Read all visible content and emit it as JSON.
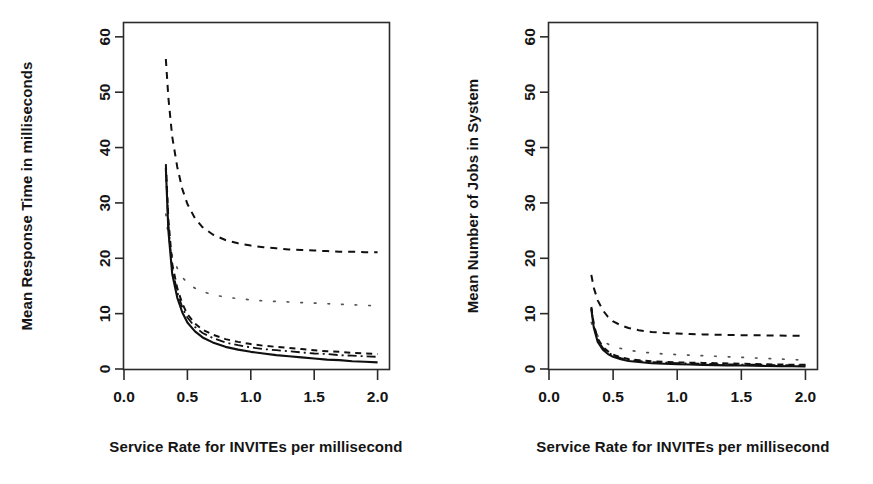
{
  "figure": {
    "background": "#ffffff",
    "foreground": "#141414",
    "panel_count": 2
  },
  "chart_data": [
    {
      "type": "line",
      "title": "",
      "xlabel": "Service Rate for INVITEs per millisecond",
      "ylabel": "Mean Response Time in milliseconds",
      "xlim": [
        0.0,
        2.09
      ],
      "ylim": [
        0.0,
        62.5
      ],
      "xticks": [
        0.0,
        0.5,
        1.0,
        1.5,
        2.0
      ],
      "xtick_labels": [
        "0.0",
        "0.5",
        "1.0",
        "1.5",
        "2.0"
      ],
      "yticks": [
        0,
        10,
        20,
        30,
        40,
        50,
        60
      ],
      "ytick_labels": [
        "0",
        "10",
        "20",
        "30",
        "40",
        "50",
        "60"
      ],
      "grid": false,
      "legend": "none",
      "x": [
        0.33,
        0.35,
        0.38,
        0.42,
        0.46,
        0.5,
        0.56,
        0.62,
        0.7,
        0.8,
        0.9,
        1.0,
        1.1,
        1.2,
        1.3,
        1.4,
        1.5,
        1.6,
        1.7,
        1.8,
        1.9,
        2.0
      ],
      "series": [
        {
          "name": "series-1-dashed-upper",
          "style": "dashed",
          "values": [
            56.0,
            49.0,
            42.0,
            36.5,
            32.5,
            29.8,
            27.2,
            25.6,
            24.3,
            23.3,
            22.7,
            22.3,
            22.0,
            21.8,
            21.6,
            21.5,
            21.4,
            21.3,
            21.2,
            21.2,
            21.1,
            21.1
          ]
        },
        {
          "name": "series-2-dotted-middle",
          "style": "dotted",
          "values": [
            28.0,
            24.0,
            20.5,
            18.2,
            16.6,
            15.5,
            14.6,
            14.0,
            13.4,
            13.0,
            12.7,
            12.5,
            12.3,
            12.2,
            12.1,
            12.0,
            11.9,
            11.8,
            11.7,
            11.6,
            11.5,
            11.4
          ]
        },
        {
          "name": "series-3-dashed-lower",
          "style": "dashed2",
          "values": [
            37.0,
            27.0,
            19.0,
            14.6,
            11.8,
            9.9,
            8.2,
            7.1,
            6.2,
            5.4,
            4.9,
            4.5,
            4.2,
            4.0,
            3.8,
            3.6,
            3.4,
            3.2,
            3.1,
            2.9,
            2.8,
            2.7
          ]
        },
        {
          "name": "series-4-dashdot-lower",
          "style": "dashdot",
          "values": [
            36.5,
            26.0,
            18.2,
            13.9,
            11.1,
            9.3,
            7.6,
            6.5,
            5.6,
            4.8,
            4.3,
            3.9,
            3.6,
            3.4,
            3.2,
            3.0,
            2.8,
            2.7,
            2.5,
            2.4,
            2.3,
            2.2
          ]
        },
        {
          "name": "series-5-solid-lowest",
          "style": "solid",
          "values": [
            36.3,
            25.0,
            17.2,
            12.9,
            10.2,
            8.4,
            6.8,
            5.7,
            4.8,
            4.0,
            3.5,
            3.1,
            2.8,
            2.5,
            2.3,
            2.1,
            1.9,
            1.7,
            1.6,
            1.4,
            1.3,
            1.2
          ]
        }
      ]
    },
    {
      "type": "line",
      "title": "",
      "xlabel": "Service Rate for INVITEs per millisecond",
      "ylabel": "Mean Number of Jobs in System",
      "xlim": [
        0.0,
        2.09
      ],
      "ylim": [
        0.0,
        62.5
      ],
      "xticks": [
        0.0,
        0.5,
        1.0,
        1.5,
        2.0
      ],
      "xtick_labels": [
        "0.0",
        "0.5",
        "1.0",
        "1.5",
        "2.0"
      ],
      "yticks": [
        0,
        10,
        20,
        30,
        40,
        50,
        60
      ],
      "ytick_labels": [
        "0",
        "10",
        "20",
        "30",
        "40",
        "50",
        "60"
      ],
      "grid": false,
      "legend": "none",
      "x": [
        0.33,
        0.35,
        0.38,
        0.42,
        0.46,
        0.5,
        0.56,
        0.62,
        0.7,
        0.8,
        0.9,
        1.0,
        1.1,
        1.2,
        1.3,
        1.4,
        1.5,
        1.6,
        1.7,
        1.8,
        1.9,
        2.0
      ],
      "series": [
        {
          "name": "series-1-dashed-upper",
          "style": "dashed",
          "values": [
            17.0,
            14.6,
            12.4,
            10.6,
            9.4,
            8.6,
            7.9,
            7.4,
            7.0,
            6.7,
            6.5,
            6.4,
            6.3,
            6.25,
            6.2,
            6.15,
            6.1,
            6.1,
            6.05,
            6.05,
            6.0,
            6.0
          ]
        },
        {
          "name": "series-2-dotted-middle",
          "style": "dotted",
          "values": [
            8.4,
            7.1,
            6.0,
            5.1,
            4.5,
            4.1,
            3.7,
            3.4,
            3.1,
            2.9,
            2.7,
            2.6,
            2.5,
            2.4,
            2.3,
            2.2,
            2.1,
            2.0,
            1.9,
            1.8,
            1.7,
            1.6
          ]
        },
        {
          "name": "series-3-dashed-lower",
          "style": "dashed2",
          "values": [
            11.2,
            8.0,
            5.5,
            4.0,
            3.2,
            2.6,
            2.1,
            1.8,
            1.6,
            1.4,
            1.3,
            1.2,
            1.15,
            1.1,
            1.05,
            1.0,
            0.95,
            0.9,
            0.85,
            0.8,
            0.78,
            0.75
          ]
        },
        {
          "name": "series-4-dashdot-lower",
          "style": "dashdot",
          "values": [
            11.0,
            7.7,
            5.2,
            3.8,
            3.0,
            2.4,
            1.95,
            1.65,
            1.45,
            1.25,
            1.15,
            1.05,
            1.0,
            0.95,
            0.9,
            0.85,
            0.8,
            0.78,
            0.74,
            0.7,
            0.67,
            0.64
          ]
        },
        {
          "name": "series-5-solid-lowest",
          "style": "solid",
          "values": [
            10.8,
            7.4,
            4.9,
            3.5,
            2.7,
            2.2,
            1.75,
            1.45,
            1.25,
            1.05,
            0.95,
            0.85,
            0.8,
            0.75,
            0.7,
            0.65,
            0.62,
            0.58,
            0.55,
            0.52,
            0.5,
            0.48
          ]
        }
      ]
    }
  ]
}
